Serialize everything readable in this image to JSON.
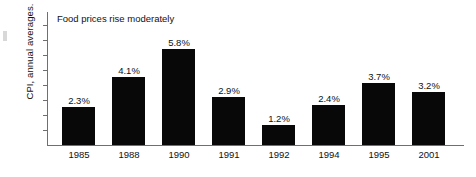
{
  "chart_data": {
    "type": "bar",
    "title": "Food prices rise moderately",
    "xlabel": "",
    "ylabel": "CPI, annual averages.",
    "categories": [
      "1985",
      "1988",
      "1990",
      "1991",
      "1992",
      "1994",
      "1995",
      "2001"
    ],
    "values": [
      2.3,
      4.1,
      5.8,
      2.9,
      1.2,
      2.4,
      3.7,
      3.2
    ],
    "value_labels": [
      "2.3%",
      "4.1%",
      "5.8%",
      "2.9%",
      "1.2%",
      "2.4%",
      "3.7%",
      "3.2%"
    ],
    "ylim": [
      0,
      8.0
    ],
    "y_tick_interval": 0.9,
    "y_tick_labels_shown": false,
    "grid": false,
    "legend": null,
    "bar_color": "#080808",
    "axis_color": "#6f6f6f",
    "text_color": "#111111",
    "background_color": "#ffffff"
  }
}
